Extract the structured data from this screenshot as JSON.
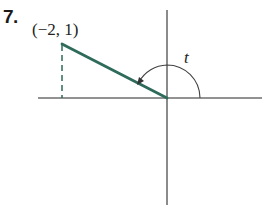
{
  "problem": {
    "number": "7."
  },
  "diagram": {
    "point": {
      "label": "(−2, 1)",
      "x": -2,
      "y": 1
    },
    "angle": {
      "label": "t",
      "direction": "counterclockwise",
      "from": "positive x-axis",
      "to": "terminal side through (−2, 1)"
    },
    "colors": {
      "axes": "#6e6e6e",
      "terminal_side": "#2e6b5a",
      "dashed": "#2e6b5a",
      "arc": "#444444"
    }
  }
}
